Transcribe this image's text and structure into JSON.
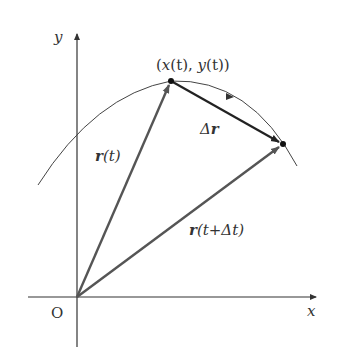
{
  "diagram": {
    "axes": {
      "x_label": "x",
      "y_label": "y",
      "origin_label": "O"
    },
    "point_label": {
      "open": "(",
      "x": "x",
      "t1": "(t), ",
      "y": "y",
      "t2": "(t))"
    },
    "vectors": {
      "r_t": {
        "bold": "r",
        "rest": "(t)"
      },
      "r_t_dt": {
        "bold": "r",
        "rest1": "(t+",
        "delta": "Δ",
        "rest2": "t)"
      },
      "delta_r": {
        "delta": "Δ",
        "bold": "r"
      }
    },
    "colors": {
      "axis": "#333333",
      "vector": "#555555",
      "delta_vector": "#222222",
      "curve": "#444444",
      "text": "#333333"
    }
  }
}
